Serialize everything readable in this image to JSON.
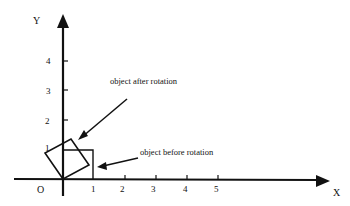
{
  "diagram": {
    "axes": {
      "x_label": "X",
      "y_label": "Y",
      "origin_label": "O",
      "x_ticks": [
        "1",
        "2",
        "3",
        "4",
        "5"
      ],
      "y_ticks": [
        "1",
        "2",
        "3",
        "4"
      ]
    },
    "annotations": {
      "after": "object after rotation",
      "before": "object before rotation"
    },
    "colors": {
      "ink": "#111111",
      "background": "#ffffff"
    }
  }
}
